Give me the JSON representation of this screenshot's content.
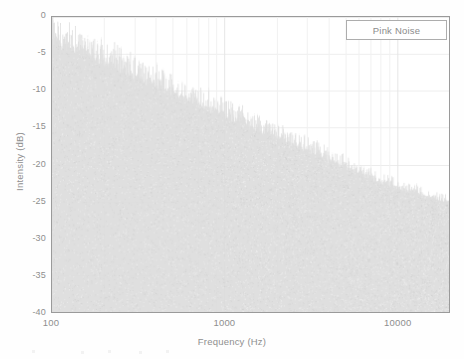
{
  "chart_data": {
    "type": "area",
    "title": "",
    "subtitle": "",
    "xlabel": "Frequency (Hz)",
    "ylabel": "Intensity (dB)",
    "xscale": "log",
    "yscale": "linear",
    "xlim": [
      100,
      20000
    ],
    "ylim": [
      -40,
      0
    ],
    "xticks": [
      100,
      1000,
      10000
    ],
    "xtick_labels": [
      "100",
      "1000",
      "10000"
    ],
    "yticks": [
      0,
      -5,
      -10,
      -15,
      -20,
      -25,
      -30,
      -35,
      -40
    ],
    "ytick_labels": [
      "0",
      "-5",
      "-10",
      "-15",
      "-20",
      "-25",
      "-30",
      "-35",
      "-40"
    ],
    "grid": true,
    "grid_color": "#ededed",
    "legend": {
      "entries": [
        "Pink Noise"
      ],
      "position": "top-right"
    },
    "series": [
      {
        "name": "Pink Noise",
        "description": "Broadband noise spectrum with ~-3 dB per octave rolloff; dense spiky trace filled down to the floor.",
        "color": "#dcdcdc",
        "slope_db_per_decade": -10.0,
        "x": [
          100,
          125,
          160,
          200,
          250,
          315,
          400,
          500,
          630,
          800,
          1000,
          1250,
          1600,
          2000,
          2500,
          3150,
          4000,
          5000,
          6300,
          8000,
          10000,
          12500,
          16000,
          20000
        ],
        "y": [
          -3.4,
          -4.3,
          -5.3,
          -6.4,
          -7.4,
          -8.4,
          -9.5,
          -10.4,
          -11.6,
          -12.6,
          -13.4,
          -14.4,
          -15.6,
          -16.5,
          -17.4,
          -18.4,
          -19.5,
          -20.4,
          -21.5,
          -22.5,
          -23.3,
          -24.0,
          -24.7,
          -25.2
        ]
      }
    ]
  },
  "figure": {
    "background": "#fefefe",
    "plot_background": "#ffffff",
    "axis_color": "#9a9a9a",
    "text_color": "#8e8e8e",
    "noise_color": "#dcdcdc"
  }
}
